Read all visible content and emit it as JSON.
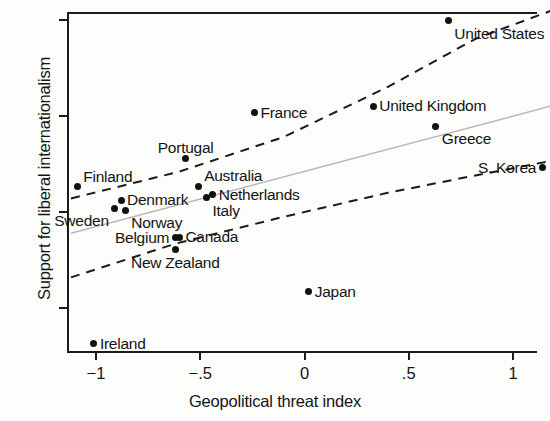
{
  "chart_data": {
    "type": "scatter",
    "title": "",
    "xlabel": "Geopolitical threat index",
    "ylabel": "Support for liberal internationalism",
    "xlim": [
      -1.12,
      1.18
    ],
    "ylim": [
      -1.46,
      2.09
    ],
    "xticks": [
      -1,
      -0.5,
      0,
      0.5,
      1
    ],
    "xticklabels": [
      "−1",
      "−.5",
      "0",
      ".5",
      "1"
    ],
    "yticks": [
      -1,
      0,
      1,
      2
    ],
    "yticklabels": [
      "−1",
      "0",
      "1",
      "2"
    ],
    "grid": false,
    "legend": false,
    "points": [
      {
        "label": "United States",
        "x": 0.69,
        "y": 1.99,
        "lx": "right",
        "ly": "below"
      },
      {
        "label": "France",
        "x": -0.24,
        "y": 1.03,
        "lx": "right",
        "ly": "mid"
      },
      {
        "label": "United Kingdom",
        "x": 0.33,
        "y": 1.1,
        "lx": "right",
        "ly": "mid"
      },
      {
        "label": "Greece",
        "x": 0.63,
        "y": 0.89,
        "lx": "right",
        "ly": "below"
      },
      {
        "label": "S. Korea",
        "x": 1.14,
        "y": 0.46,
        "lx": "left",
        "ly": "mid"
      },
      {
        "label": "Portugal",
        "x": -0.57,
        "y": 0.56,
        "lx": "center",
        "ly": "above"
      },
      {
        "label": "Australia",
        "x": -0.51,
        "y": 0.27,
        "lx": "right",
        "ly": "above"
      },
      {
        "label": "Netherlands",
        "x": -0.44,
        "y": 0.18,
        "lx": "right",
        "ly": "mid"
      },
      {
        "label": "Italy",
        "x": -0.47,
        "y": 0.15,
        "lx": "right",
        "ly": "below"
      },
      {
        "label": "Finland",
        "x": -1.09,
        "y": 0.26,
        "lx": "right",
        "ly": "above"
      },
      {
        "label": "Denmark",
        "x": -0.88,
        "y": 0.12,
        "lx": "right",
        "ly": "mid"
      },
      {
        "label": "Norway",
        "x": -0.86,
        "y": 0.02,
        "lx": "right",
        "ly": "below"
      },
      {
        "label": "Sweden",
        "x": -0.91,
        "y": 0.04,
        "lx": "left",
        "ly": "below"
      },
      {
        "label": "Belgium",
        "x": -0.62,
        "y": -0.27,
        "lx": "left",
        "ly": "mid"
      },
      {
        "label": "Canada",
        "x": -0.6,
        "y": -0.26,
        "lx": "right",
        "ly": "mid"
      },
      {
        "label": "New Zealand",
        "x": -0.62,
        "y": -0.39,
        "lx": "center",
        "ly": "below"
      },
      {
        "label": "Japan",
        "x": 0.02,
        "y": -0.83,
        "lx": "right",
        "ly": "mid"
      },
      {
        "label": "Ireland",
        "x": -1.01,
        "y": -1.37,
        "lx": "right",
        "ly": "mid"
      }
    ],
    "fit_line": {
      "style": "solid-gray",
      "x0": -1.12,
      "y0": -0.22,
      "x1": 1.18,
      "y1": 1.1
    },
    "ci_upper": {
      "style": "dashed",
      "points": [
        [
          -1.12,
          0.14
        ],
        [
          -0.6,
          0.42
        ],
        [
          -0.1,
          0.78
        ],
        [
          0.4,
          1.3
        ],
        [
          0.82,
          1.8
        ],
        [
          1.18,
          2.09
        ]
      ]
    },
    "ci_lower": {
      "style": "dashed",
      "points": [
        [
          -1.12,
          -0.68
        ],
        [
          -0.62,
          -0.33
        ],
        [
          -0.1,
          -0.05
        ],
        [
          0.4,
          0.2
        ],
        [
          0.82,
          0.38
        ],
        [
          1.18,
          0.53
        ]
      ]
    }
  }
}
